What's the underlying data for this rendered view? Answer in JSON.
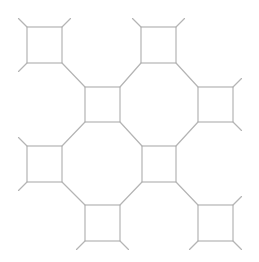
{
  "diagram": {
    "stroke_color": "#b4b4b4",
    "background": "#ffffff",
    "tail_length": 12,
    "squares": [
      {
        "id": "A",
        "x1": 27,
        "y1": 27,
        "x2": 62,
        "y2": 63
      },
      {
        "id": "C",
        "x1": 141,
        "y1": 27,
        "x2": 176,
        "y2": 63
      },
      {
        "id": "B",
        "x1": 85,
        "y1": 87,
        "x2": 120,
        "y2": 122
      },
      {
        "id": "D",
        "x1": 198,
        "y1": 87,
        "x2": 233,
        "y2": 122
      },
      {
        "id": "E",
        "x1": 27,
        "y1": 146,
        "x2": 62,
        "y2": 182
      },
      {
        "id": "G",
        "x1": 142,
        "y1": 146,
        "x2": 176,
        "y2": 182
      },
      {
        "id": "F",
        "x1": 85,
        "y1": 205,
        "x2": 120,
        "y2": 241
      },
      {
        "id": "H",
        "x1": 198,
        "y1": 205,
        "x2": 233,
        "y2": 241
      }
    ],
    "connections": [
      [
        "A",
        "br",
        "B",
        "tl"
      ],
      [
        "C",
        "bl",
        "B",
        "tr"
      ],
      [
        "C",
        "br",
        "D",
        "tl"
      ],
      [
        "B",
        "bl",
        "E",
        "tr"
      ],
      [
        "B",
        "br",
        "G",
        "tl"
      ],
      [
        "D",
        "bl",
        "G",
        "tr"
      ],
      [
        "E",
        "br",
        "F",
        "tl"
      ],
      [
        "G",
        "bl",
        "F",
        "tr"
      ],
      [
        "G",
        "br",
        "H",
        "tl"
      ]
    ]
  }
}
